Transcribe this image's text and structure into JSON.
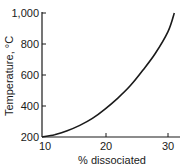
{
  "chart_data": {
    "type": "line",
    "title": "",
    "xlabel": "% dissociated",
    "ylabel": "Temperature, °C",
    "xlim": [
      10,
      32
    ],
    "ylim": [
      200,
      1000
    ],
    "grid": false,
    "legend": null,
    "x_ticks": [
      "10",
      "20",
      "30"
    ],
    "y_ticks": [
      "200",
      "400",
      "600",
      "800",
      "1,000"
    ],
    "series": [
      {
        "name": "dissociation curve",
        "x": [
          10,
          12,
          14,
          16,
          18,
          20,
          22,
          24,
          26,
          28,
          30,
          31
        ],
        "y": [
          200,
          215,
          240,
          275,
          320,
          380,
          450,
          530,
          630,
          740,
          880,
          1000
        ]
      }
    ]
  }
}
